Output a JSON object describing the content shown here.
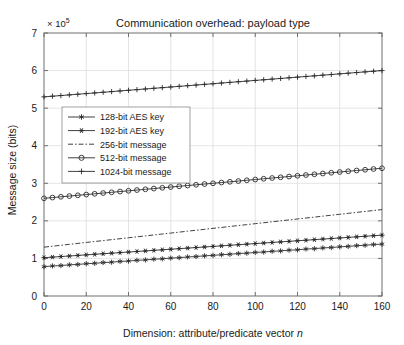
{
  "chart_data": {
    "type": "line",
    "title": "Communication overhead: payload type",
    "xlabel": "Dimension: attribute/predicate vector n",
    "xlabel_plain": "Dimension: attribute/predicate vector ",
    "xlabel_italic": "n",
    "ylabel": "Message size (bits)",
    "y_exponent_label": "× 10",
    "y_exponent_power": "5",
    "y_scale_factor": 100000,
    "xlim": [
      0,
      160
    ],
    "ylim": [
      0,
      7
    ],
    "xticks": [
      0,
      20,
      40,
      60,
      80,
      100,
      120,
      140,
      160
    ],
    "yticks": [
      0,
      1,
      2,
      3,
      4,
      5,
      6,
      7
    ],
    "xticklabels": [
      "0",
      "20",
      "40",
      "60",
      "80",
      "100",
      "120",
      "140",
      "160"
    ],
    "yticklabels": [
      "0",
      "1",
      "2",
      "3",
      "4",
      "5",
      "6",
      "7"
    ],
    "grid": true,
    "legend_position": "upper left",
    "x": [
      0,
      4,
      8,
      12,
      16,
      20,
      24,
      28,
      32,
      36,
      40,
      44,
      48,
      52,
      56,
      60,
      64,
      68,
      72,
      76,
      80,
      84,
      88,
      92,
      96,
      100,
      104,
      108,
      112,
      116,
      120,
      124,
      128,
      132,
      136,
      140,
      144,
      148,
      152,
      156,
      160
    ],
    "series": [
      {
        "name": "128-bit AES key",
        "marker": "star",
        "linestyle": "solid",
        "values": [
          0.78,
          0.8,
          0.81,
          0.83,
          0.84,
          0.86,
          0.87,
          0.89,
          0.9,
          0.92,
          0.93,
          0.95,
          0.96,
          0.98,
          0.99,
          1.01,
          1.02,
          1.04,
          1.05,
          1.07,
          1.08,
          1.1,
          1.11,
          1.13,
          1.14,
          1.16,
          1.17,
          1.19,
          1.2,
          1.22,
          1.23,
          1.25,
          1.26,
          1.28,
          1.29,
          1.31,
          1.32,
          1.34,
          1.35,
          1.37,
          1.38
        ]
      },
      {
        "name": "192-bit AES key",
        "marker": "asterisk-filled",
        "linestyle": "solid",
        "values": [
          1.02,
          1.035,
          1.05,
          1.065,
          1.08,
          1.095,
          1.11,
          1.125,
          1.14,
          1.155,
          1.17,
          1.185,
          1.2,
          1.215,
          1.23,
          1.245,
          1.26,
          1.275,
          1.29,
          1.305,
          1.32,
          1.335,
          1.35,
          1.365,
          1.38,
          1.395,
          1.41,
          1.425,
          1.44,
          1.455,
          1.47,
          1.485,
          1.5,
          1.515,
          1.53,
          1.545,
          1.56,
          1.575,
          1.59,
          1.605,
          1.62
        ]
      },
      {
        "name": "256-bit message",
        "marker": "none",
        "linestyle": "dashdot",
        "values": [
          1.3,
          1.325,
          1.35,
          1.375,
          1.4,
          1.425,
          1.45,
          1.475,
          1.5,
          1.525,
          1.55,
          1.575,
          1.6,
          1.625,
          1.65,
          1.675,
          1.7,
          1.725,
          1.75,
          1.775,
          1.8,
          1.825,
          1.85,
          1.875,
          1.9,
          1.925,
          1.95,
          1.975,
          2.0,
          2.025,
          2.05,
          2.075,
          2.1,
          2.125,
          2.15,
          2.175,
          2.2,
          2.225,
          2.25,
          2.275,
          2.3
        ]
      },
      {
        "name": "512-bit message",
        "marker": "circle",
        "linestyle": "solid",
        "values": [
          2.6,
          2.62,
          2.64,
          2.66,
          2.68,
          2.7,
          2.72,
          2.74,
          2.76,
          2.78,
          2.8,
          2.82,
          2.84,
          2.86,
          2.88,
          2.9,
          2.92,
          2.94,
          2.96,
          2.98,
          3.0,
          3.02,
          3.04,
          3.06,
          3.08,
          3.1,
          3.12,
          3.14,
          3.16,
          3.18,
          3.2,
          3.22,
          3.24,
          3.26,
          3.28,
          3.3,
          3.32,
          3.34,
          3.36,
          3.38,
          3.4
        ]
      },
      {
        "name": "1024-bit message",
        "marker": "plus",
        "linestyle": "solid",
        "values": [
          5.3,
          5.318,
          5.335,
          5.353,
          5.37,
          5.388,
          5.405,
          5.423,
          5.44,
          5.458,
          5.475,
          5.493,
          5.51,
          5.528,
          5.545,
          5.563,
          5.58,
          5.598,
          5.615,
          5.633,
          5.65,
          5.668,
          5.685,
          5.703,
          5.72,
          5.738,
          5.755,
          5.773,
          5.79,
          5.808,
          5.825,
          5.843,
          5.86,
          5.878,
          5.895,
          5.913,
          5.93,
          5.948,
          5.965,
          5.983,
          6.0
        ]
      }
    ],
    "colors": {
      "line": "#2b2b2b",
      "grid": "#d9d9d9",
      "axis": "#6e6e6e",
      "background": "#ffffff",
      "text": "#1a1a1a"
    }
  }
}
